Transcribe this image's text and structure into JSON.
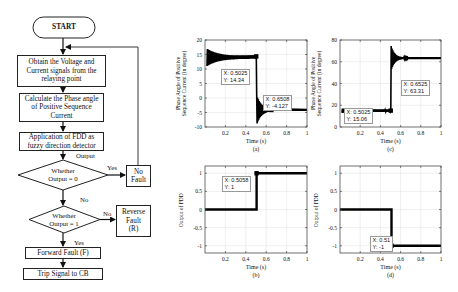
{
  "flowchart": {
    "start": "START",
    "step1": [
      "Obtain the Voltage and",
      "Current signals from the",
      "relaying point"
    ],
    "step2": [
      "Calculate the Phase angle",
      "of Positive Sequence",
      "Current"
    ],
    "step3": [
      "Application of FDD as",
      "fuzzy direction detector"
    ],
    "output_label": "Output",
    "decision1": [
      "Whether",
      "Output = 0"
    ],
    "decision1_yes": "Yes",
    "no_fault": [
      "No",
      "Fault"
    ],
    "decision1_no": "No",
    "decision2": [
      "Whether",
      "Output = 1"
    ],
    "decision2_no": "No",
    "reverse_fault": [
      "Reverse",
      "Fault",
      "(R)"
    ],
    "decision2_yes": "Yes",
    "forward_fault": "Forward Fault (F)",
    "trip": "Trip Signal to CB"
  },
  "chart_data": [
    {
      "id": "a",
      "type": "line",
      "caption": "(a)",
      "xlabel": "Time (s)",
      "ylabel": [
        "Phase Angle of Positive",
        "Sequence Current (in degree)"
      ],
      "xlim": [
        0,
        1
      ],
      "ylim": [
        -10,
        20
      ],
      "xticks": [
        "0.2",
        "0.4",
        "0.6",
        "0.8",
        "1"
      ],
      "yticks": [
        "-10",
        "-5",
        "0",
        "5",
        "10",
        "15",
        "20"
      ],
      "grid": true,
      "series": [
        {
          "name": "phase angle",
          "x": [
            0.02,
            0.5025,
            0.51,
            0.52,
            0.54,
            0.56,
            0.6,
            0.6508,
            1.0
          ],
          "y": [
            14,
            14.34,
            5,
            -3,
            -8,
            -3,
            -4.5,
            -4.127,
            -4.1
          ]
        }
      ],
      "datatips": [
        {
          "x_label": "X: 0.5025",
          "y_label": "Y: 14.34"
        },
        {
          "x_label": "X: 0.6508",
          "y_label": "Y: -4.127"
        }
      ]
    },
    {
      "id": "c",
      "type": "line",
      "caption": "(c)",
      "xlabel": "Time (s)",
      "ylabel": [
        "Phase Angle of Positive",
        "Sequence Current (in degree)"
      ],
      "xlim": [
        0,
        1
      ],
      "ylim": [
        0,
        80
      ],
      "xticks": [
        "0.2",
        "0.4",
        "0.6",
        "0.8",
        "1"
      ],
      "yticks": [
        "0",
        "20",
        "40",
        "60",
        "80"
      ],
      "grid": true,
      "series": [
        {
          "name": "phase angle",
          "x": [
            0.02,
            0.5025,
            0.51,
            0.52,
            0.54,
            0.6,
            0.6525,
            1.0
          ],
          "y": [
            15,
            15.06,
            40,
            75,
            60,
            64,
            63.31,
            63.3
          ]
        }
      ],
      "datatips": [
        {
          "x_label": "X: 0.5025",
          "y_label": "Y: 15.06"
        },
        {
          "x_label": "X: 0.6525",
          "y_label": "Y: 63.31"
        }
      ]
    },
    {
      "id": "b",
      "type": "line",
      "caption": "(b)",
      "xlabel": "Time (s)",
      "ylabel": [
        "Output of FDD"
      ],
      "xlim": [
        0,
        1
      ],
      "ylim": [
        -1.2,
        1.2
      ],
      "xticks": [
        "0.2",
        "0.4",
        "0.6",
        "0.8",
        "1"
      ],
      "yticks": [
        "-1",
        "-0.5",
        "0",
        "0.5",
        "1"
      ],
      "grid": true,
      "series": [
        {
          "name": "FDD output",
          "x": [
            0,
            0.5058,
            0.5058,
            1.0
          ],
          "y": [
            0,
            0,
            1,
            1
          ]
        }
      ],
      "datatips": [
        {
          "x_label": "X: 0.5058",
          "y_label": "Y: 1"
        }
      ]
    },
    {
      "id": "d",
      "type": "line",
      "caption": "(d)",
      "xlabel": "Time (s)",
      "ylabel": [
        "Output of FDD"
      ],
      "xlim": [
        0,
        1
      ],
      "ylim": [
        -1.2,
        1.2
      ],
      "xticks": [
        "0.2",
        "0.4",
        "0.6",
        "0.8",
        "1"
      ],
      "yticks": [
        "-1",
        "-0.5",
        "0",
        "0.5",
        "1"
      ],
      "grid": true,
      "series": [
        {
          "name": "FDD output",
          "x": [
            0,
            0.51,
            0.51,
            1.0
          ],
          "y": [
            0,
            0,
            -1,
            -1
          ]
        }
      ],
      "datatips": [
        {
          "x_label": "X: 0.51",
          "y_label": "Y: -1"
        }
      ]
    }
  ]
}
